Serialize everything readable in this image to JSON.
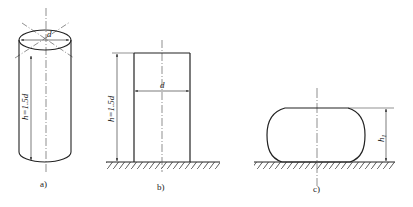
{
  "figure": {
    "stroke_color": "#222222",
    "panels": [
      {
        "id": "a",
        "caption": "a)",
        "dimension_label": "h=1.5d",
        "diameter_label": "d"
      },
      {
        "id": "b",
        "caption": "b)",
        "dimension_label": "h=1.5d",
        "diameter_label": "d"
      },
      {
        "id": "c",
        "caption": "c)",
        "dimension_label": "h",
        "dimension_subscript": "1"
      }
    ]
  }
}
